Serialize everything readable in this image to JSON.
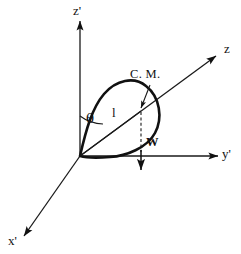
{
  "figure": {
    "background_color": "#ffffff",
    "line_color": "#111111"
  },
  "axes": [
    {
      "id": "z-prime",
      "label": "z'",
      "description": "vertical axis pointing up from origin",
      "arrow": "up"
    },
    {
      "id": "y-prime",
      "label": "y'",
      "description": "horizontal axis pointing right from origin",
      "arrow": "right"
    },
    {
      "id": "x-prime",
      "label": "x'",
      "description": "oblique axis pointing down-left from origin",
      "arrow": "down-left"
    },
    {
      "id": "z",
      "label": "z",
      "description": "body axis pointing up-right through the pendulum",
      "arrow": "up-right"
    }
  ],
  "annotations": {
    "angle_label": "θ",
    "length_label": "l",
    "center_of_mass_label": "C. M.",
    "weight_label": "W"
  },
  "icons": {
    "arrowhead": "arrowhead-icon",
    "cm-pointer": "cm-leader-arrow-icon",
    "weight-arrow": "weight-down-arrow-icon"
  }
}
